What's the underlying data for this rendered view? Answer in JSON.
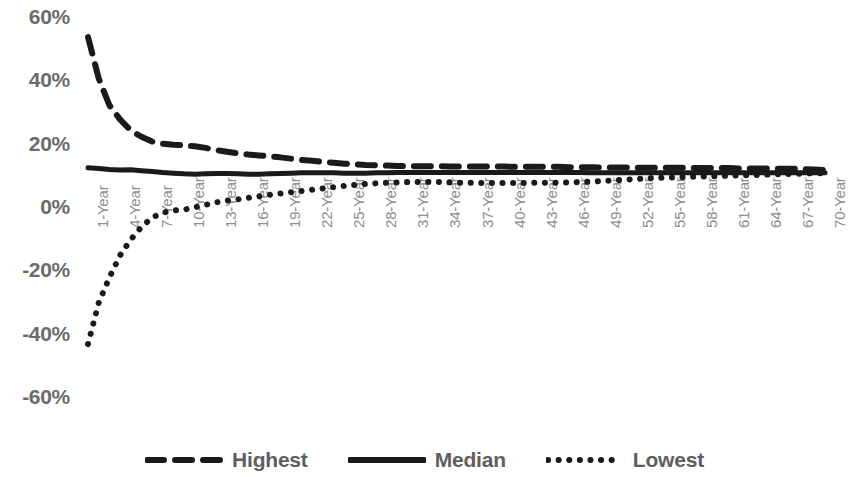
{
  "chart_data": {
    "type": "line",
    "title": "",
    "xlabel": "",
    "ylabel": "",
    "ylim": [
      -60,
      60
    ],
    "ytick_labels": [
      "60%",
      "40%",
      "20%",
      "0%",
      "-20%",
      "-40%",
      "-60%"
    ],
    "ytick_values": [
      60,
      40,
      20,
      0,
      -20,
      -40,
      -60
    ],
    "grid": false,
    "legend_position": "bottom",
    "x": [
      1,
      2,
      3,
      4,
      5,
      6,
      7,
      8,
      9,
      10,
      11,
      12,
      13,
      14,
      15,
      16,
      17,
      18,
      19,
      20,
      21,
      22,
      23,
      24,
      25,
      26,
      27,
      28,
      29,
      30,
      31,
      32,
      33,
      34,
      35,
      36,
      37,
      38,
      39,
      40,
      41,
      42,
      43,
      44,
      45,
      46,
      47,
      48,
      49,
      50,
      51,
      52,
      53,
      54,
      55,
      56,
      57,
      58,
      59,
      60,
      61,
      62,
      63,
      64,
      65,
      66,
      67,
      68,
      69,
      70
    ],
    "xtick_labels": [
      "1-Year",
      "4-Year",
      "7-Year",
      "10-Year",
      "13-Year",
      "16-Year",
      "19-Year",
      "22-Year",
      "25-Year",
      "28-Year",
      "31-Year",
      "34-Year",
      "37-Year",
      "40-Year",
      "43-Year",
      "46-Year",
      "49-Year",
      "52-Year",
      "55-Year",
      "58-Year",
      "61-Year",
      "64-Year",
      "67-Year",
      "70-Year"
    ],
    "xtick_values": [
      1,
      4,
      7,
      10,
      13,
      16,
      19,
      22,
      25,
      28,
      31,
      34,
      37,
      40,
      43,
      46,
      49,
      52,
      55,
      58,
      61,
      64,
      67,
      70
    ],
    "series": [
      {
        "name": "Highest",
        "style": "dashed",
        "color": "#1a1a1a",
        "values": [
          54.0,
          41.0,
          32.5,
          28.0,
          24.5,
          22.5,
          21.0,
          20.3,
          20.0,
          19.8,
          19.5,
          19.0,
          18.3,
          17.8,
          17.3,
          16.9,
          16.6,
          16.3,
          16.0,
          15.6,
          15.2,
          14.9,
          14.6,
          14.3,
          14.0,
          13.8,
          13.6,
          13.5,
          13.4,
          13.3,
          13.2,
          13.2,
          13.2,
          13.2,
          13.1,
          13.1,
          13.1,
          13.1,
          13.1,
          13.1,
          13.0,
          13.0,
          13.0,
          13.0,
          13.0,
          12.9,
          12.9,
          12.9,
          12.8,
          12.8,
          12.8,
          12.8,
          12.7,
          12.7,
          12.7,
          12.7,
          12.7,
          12.6,
          12.6,
          12.6,
          12.6,
          12.5,
          12.5,
          12.5,
          12.4,
          12.4,
          12.4,
          12.3,
          12.2,
          12.0
        ]
      },
      {
        "name": "Median",
        "style": "solid",
        "color": "#1a1a1a",
        "values": [
          12.7,
          12.5,
          12.2,
          12.0,
          12.1,
          11.8,
          11.5,
          11.2,
          11.0,
          10.8,
          10.7,
          10.8,
          10.9,
          10.9,
          10.8,
          10.7,
          10.7,
          10.8,
          10.9,
          11.0,
          11.1,
          11.1,
          11.1,
          11.1,
          11.0,
          11.0,
          11.0,
          11.1,
          11.1,
          11.2,
          11.2,
          11.2,
          11.2,
          11.2,
          11.2,
          11.2,
          11.2,
          11.2,
          11.2,
          11.2,
          11.2,
          11.2,
          11.2,
          11.2,
          11.2,
          11.2,
          11.2,
          11.1,
          11.1,
          11.1,
          11.1,
          11.1,
          11.1,
          11.1,
          11.1,
          11.1,
          11.1,
          11.1,
          11.1,
          11.1,
          11.1,
          11.1,
          11.1,
          11.1,
          11.1,
          11.1,
          11.1,
          11.1,
          11.1,
          11.1
        ]
      },
      {
        "name": "Lowest",
        "style": "dotted",
        "color": "#1a1a1a",
        "values": [
          -43.0,
          -30.0,
          -22.0,
          -15.0,
          -10.0,
          -6.0,
          -3.0,
          -1.5,
          -0.8,
          -0.5,
          0.2,
          1.0,
          1.8,
          2.3,
          2.7,
          3.2,
          3.7,
          4.2,
          4.6,
          5.0,
          5.4,
          5.8,
          6.2,
          6.6,
          7.0,
          7.3,
          7.6,
          7.8,
          8.0,
          8.1,
          8.2,
          8.2,
          8.2,
          8.2,
          8.1,
          8.0,
          8.0,
          7.9,
          7.9,
          7.9,
          7.9,
          7.9,
          8.0,
          8.0,
          8.0,
          8.1,
          8.2,
          8.3,
          8.5,
          8.7,
          8.9,
          9.1,
          9.3,
          9.5,
          9.6,
          9.7,
          9.8,
          9.9,
          10.0,
          10.1,
          10.2,
          10.3,
          10.4,
          10.5,
          10.6,
          10.7,
          10.8,
          10.9,
          11.0,
          11.0
        ]
      }
    ],
    "legend": [
      "Highest",
      "Median",
      "Lowest"
    ]
  }
}
